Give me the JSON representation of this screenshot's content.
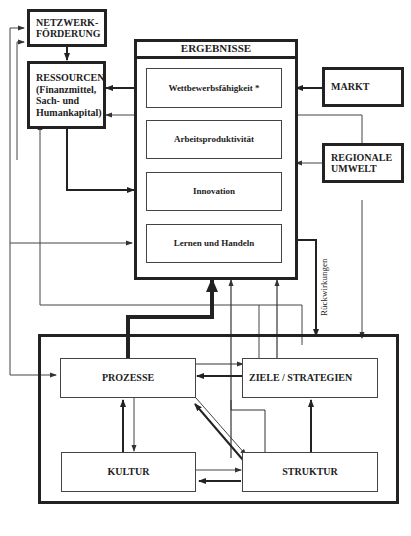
{
  "diagram": {
    "boxes": {
      "netzwerk": "NETZWERK-\nFÖRDERUNG",
      "ressourcen": "RESSOURCEN\n(Finanzmittel,\nSach- und\nHumankapital)",
      "ergebnisse_title": "ERGEBNISSE",
      "wettbewerb": "Wettbewerbsfähigkeit *",
      "arbeit": "Arbeitsproduktivität",
      "innovation": "Innovation",
      "lernen": "Lernen und Handeln",
      "markt": "MARKT",
      "regionale": "REGIONALE\nUMWELT",
      "prozesse": "PROZESSE",
      "ziele": "ZIELE / STRATEGIEN",
      "kultur": "KULTUR",
      "struktur": "STRUKTUR"
    },
    "labels": {
      "rueckwirkungen": "Rückwirkungen"
    },
    "colors": {
      "line": "#222222",
      "thin_line": "#444444",
      "background": "#ffffff"
    }
  }
}
